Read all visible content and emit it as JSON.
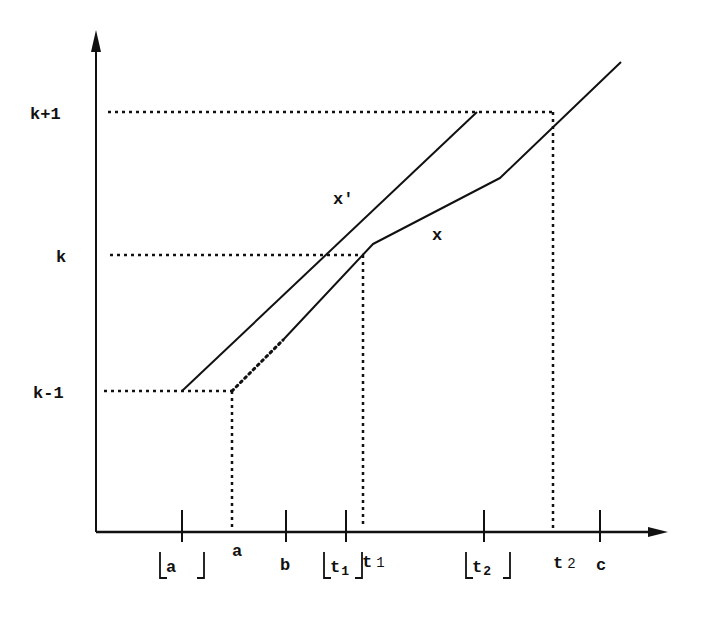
{
  "colors": {
    "ink": "#111111",
    "background": "#ffffff"
  },
  "axes": {
    "origin": [
      96,
      532
    ],
    "y_axis_top": 30,
    "x_axis_right": 668
  },
  "y_levels": [
    {
      "id": "k_plus_1",
      "label": "k+1",
      "y": 112,
      "label_x": 30,
      "label_y": 119,
      "dotted_from": 108,
      "dotted_to": 553
    },
    {
      "id": "k",
      "label": "k",
      "y": 255,
      "label_x": 56,
      "label_y": 262,
      "dotted_from": 110,
      "dotted_to": 363
    },
    {
      "id": "k_minus_1",
      "label": "k-1",
      "y": 391,
      "label_x": 33,
      "label_y": 398,
      "dotted_from": 104,
      "dotted_to": 232
    }
  ],
  "ticks": [
    {
      "id": "floor_a",
      "x": 182,
      "label": "a",
      "floor": true
    },
    {
      "id": "b",
      "x": 286,
      "label": "b",
      "floor": false
    },
    {
      "id": "floor_t1",
      "x": 346,
      "label": "t",
      "sub": "1",
      "floor": true
    },
    {
      "id": "floor_t2",
      "x": 484,
      "label": "t",
      "sub": "2",
      "floor": true
    },
    {
      "id": "c",
      "x": 600,
      "label": "c",
      "floor": false
    }
  ],
  "x_labels": [
    {
      "id": "a",
      "text": "a",
      "x": 232,
      "y": 556
    },
    {
      "id": "b",
      "text": "b",
      "x": 280,
      "y": 570
    },
    {
      "id": "t1",
      "text": "t",
      "sub": "1",
      "x": 362,
      "y": 567
    },
    {
      "id": "t2",
      "text": "t",
      "sub": "2",
      "x": 553,
      "y": 568
    },
    {
      "id": "c",
      "text": "c",
      "x": 596,
      "y": 570
    }
  ],
  "floor_labels": [
    {
      "id": "floor_a",
      "text": "a",
      "x": 160,
      "y": 574,
      "width": 44
    },
    {
      "id": "floor_t1",
      "text": "t",
      "sub": "1",
      "x": 324,
      "y": 574,
      "width": 38
    },
    {
      "id": "floor_t2",
      "text": "t",
      "sub": "2",
      "x": 466,
      "y": 574,
      "width": 44
    }
  ],
  "vertical_guides": [
    {
      "id": "a_guide",
      "x": 232,
      "from": 391,
      "to": 528
    },
    {
      "id": "t1_guide",
      "x": 363,
      "from": 255,
      "to": 528
    },
    {
      "id": "t2_guide",
      "x": 553,
      "from": 112,
      "to": 528
    }
  ],
  "curves": [
    {
      "id": "x_prime",
      "label": "x′",
      "label_x": 333,
      "label_y": 204,
      "points": [
        [
          182,
          391
        ],
        [
          477,
          112
        ]
      ]
    },
    {
      "id": "x",
      "label": "x",
      "label_x": 432,
      "label_y": 240,
      "dotted_points": [
        [
          232,
          391
        ],
        [
          283,
          340
        ]
      ],
      "points": [
        [
          283,
          340
        ],
        [
          373,
          244
        ],
        [
          500,
          178
        ],
        [
          621,
          62
        ]
      ]
    }
  ]
}
